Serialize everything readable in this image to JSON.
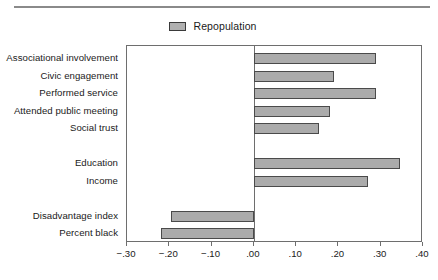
{
  "legend": {
    "swatch_name": "repopulation-swatch",
    "label": "Repopulation",
    "bar_fill_color": "#ababab",
    "bar_border_color": "#4a4a4a"
  },
  "axis": {
    "tick_labels": [
      "−.30",
      "−.20",
      "−.10",
      ".00",
      ".10",
      ".20",
      ".30",
      ".40"
    ],
    "tick_values": [
      -0.3,
      -0.2,
      -0.1,
      0.0,
      0.1,
      0.2,
      0.3,
      0.4
    ]
  },
  "chart_data": {
    "type": "bar",
    "orientation": "horizontal",
    "title": "",
    "subtitle": "",
    "xlabel": "",
    "ylabel": "",
    "xlim": [
      -0.3,
      0.4
    ],
    "grid": false,
    "legend_position": "top-center",
    "zero_reference_line": 0.0,
    "categories": [
      "Associational involvement",
      "Civic engagement",
      "Performed service",
      "Attended public meeting",
      "Social trust",
      "Education",
      "Income",
      "Disadvantage index",
      "Percent black"
    ],
    "groups": [
      {
        "members": [
          "Associational involvement",
          "Civic engagement",
          "Performed service",
          "Attended public meeting",
          "Social trust"
        ]
      },
      {
        "members": [
          "Education",
          "Income"
        ]
      },
      {
        "members": [
          "Disadvantage index",
          "Percent black"
        ]
      }
    ],
    "series": [
      {
        "name": "Repopulation",
        "values": [
          0.29,
          0.19,
          0.29,
          0.18,
          0.155,
          0.345,
          0.27,
          -0.195,
          -0.22
        ]
      }
    ],
    "tick_labels": [
      "−.30",
      "−.20",
      "−.10",
      ".00",
      ".10",
      ".20",
      ".30",
      ".40"
    ]
  }
}
